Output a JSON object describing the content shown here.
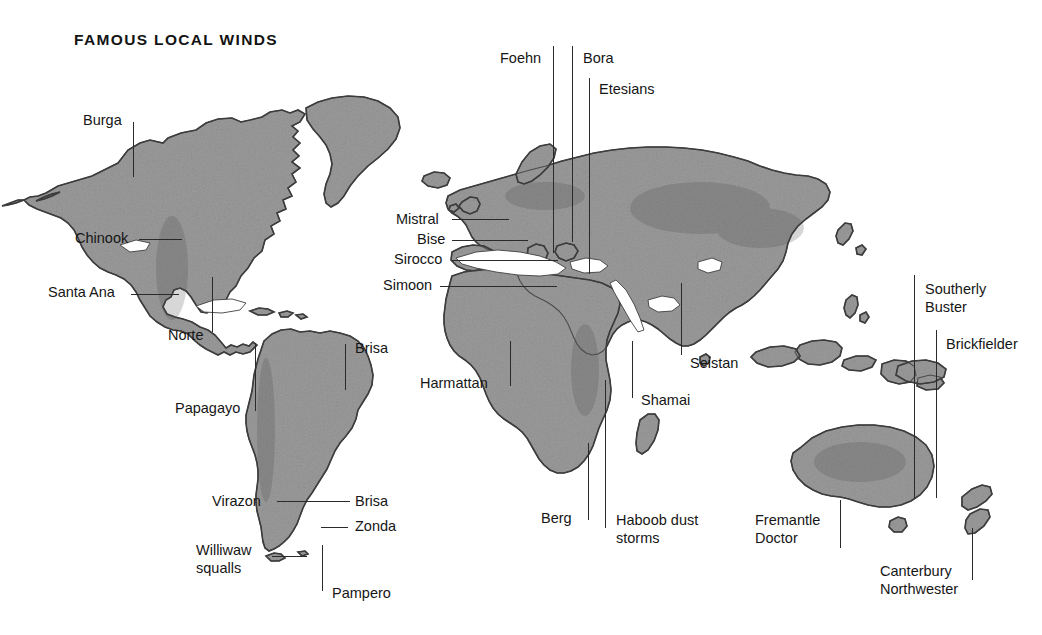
{
  "figure": {
    "title": "FAMOUS LOCAL WINDS",
    "background_color": "#ffffff",
    "land_color": "#9a9a9a",
    "coast_color": "#3a3a3a",
    "label_color": "#161616",
    "leader_color": "#2a2a2a",
    "width": 1042,
    "height": 635
  },
  "winds": [
    {
      "id": "burga",
      "name": "Burga",
      "label_x": 83,
      "label_y": 112,
      "align": "left"
    },
    {
      "id": "chinook",
      "name": "Chinook",
      "label_x": 75,
      "label_y": 230,
      "align": "left"
    },
    {
      "id": "santa-ana",
      "name": "Santa Ana",
      "label_x": 48,
      "label_y": 284,
      "align": "left"
    },
    {
      "id": "norte",
      "name": "Norte",
      "label_x": 168,
      "label_y": 327,
      "align": "left"
    },
    {
      "id": "brisa-north",
      "name": "Brisa",
      "label_x": 355,
      "label_y": 340,
      "align": "left"
    },
    {
      "id": "papagayo",
      "name": "Papagayo",
      "label_x": 175,
      "label_y": 400,
      "align": "left"
    },
    {
      "id": "virazon",
      "name": "Virazon",
      "label_x": 212,
      "label_y": 493,
      "align": "left"
    },
    {
      "id": "brisa-south",
      "name": "Brisa",
      "label_x": 355,
      "label_y": 493,
      "align": "left"
    },
    {
      "id": "zonda",
      "name": "Zonda",
      "label_x": 355,
      "label_y": 518,
      "align": "left"
    },
    {
      "id": "williwaw-squalls",
      "name": "Williwaw\nsqualls",
      "label_x": 196,
      "label_y": 542,
      "align": "left"
    },
    {
      "id": "pampero",
      "name": "Pampero",
      "label_x": 332,
      "label_y": 585,
      "align": "left"
    },
    {
      "id": "foehn",
      "name": "Foehn",
      "label_x": 500,
      "label_y": 50,
      "align": "left"
    },
    {
      "id": "bora",
      "name": "Bora",
      "label_x": 583,
      "label_y": 50,
      "align": "left"
    },
    {
      "id": "etesians",
      "name": "Etesians",
      "label_x": 599,
      "label_y": 81,
      "align": "left"
    },
    {
      "id": "mistral",
      "name": "Mistral",
      "label_x": 396,
      "label_y": 211,
      "align": "left"
    },
    {
      "id": "bise",
      "name": "Bise",
      "label_x": 417,
      "label_y": 231,
      "align": "left"
    },
    {
      "id": "sirocco",
      "name": "Sirocco",
      "label_x": 394,
      "label_y": 251,
      "align": "left"
    },
    {
      "id": "simoon",
      "name": "Simoon",
      "label_x": 383,
      "label_y": 277,
      "align": "left"
    },
    {
      "id": "harmattan",
      "name": "Harmattan",
      "label_x": 420,
      "label_y": 375,
      "align": "left"
    },
    {
      "id": "berg",
      "name": "Berg",
      "label_x": 541,
      "label_y": 510,
      "align": "left"
    },
    {
      "id": "haboob-dust-storms",
      "name": "Haboob dust\nstorms",
      "label_x": 616,
      "label_y": 512,
      "align": "left"
    },
    {
      "id": "shamai",
      "name": "Shamai",
      "label_x": 641,
      "label_y": 392,
      "align": "left"
    },
    {
      "id": "seistan",
      "name": "Seistan",
      "label_x": 690,
      "label_y": 355,
      "align": "left"
    },
    {
      "id": "southerly-buster",
      "name": "Southerly\nBuster",
      "label_x": 925,
      "label_y": 281,
      "align": "left"
    },
    {
      "id": "brickfielder",
      "name": "Brickfielder",
      "label_x": 946,
      "label_y": 336,
      "align": "left"
    },
    {
      "id": "fremantle-doctor",
      "name": "Fremantle\nDoctor",
      "label_x": 755,
      "label_y": 512,
      "align": "left"
    },
    {
      "id": "canterbury-northwester",
      "name": "Canterbury\nNorthwester",
      "label_x": 880,
      "label_y": 563,
      "align": "left"
    }
  ],
  "leaders": [
    {
      "id": "burga-leader",
      "orient": "vertical",
      "x": 133,
      "y": 122,
      "length": 55
    },
    {
      "id": "chinook-leader",
      "orient": "horizontal",
      "x": 139,
      "y": 239,
      "length": 43
    },
    {
      "id": "santa-ana-leader",
      "orient": "horizontal",
      "x": 131,
      "y": 294,
      "length": 48
    },
    {
      "id": "norte-leader",
      "orient": "vertical",
      "x": 212,
      "y": 277,
      "length": 55
    },
    {
      "id": "brisa-north-leader",
      "orient": "vertical",
      "x": 345,
      "y": 344,
      "length": 46
    },
    {
      "id": "papagayo-leader",
      "orient": "vertical",
      "x": 255,
      "y": 343,
      "length": 68
    },
    {
      "id": "virazon-leader",
      "orient": "horizontal",
      "x": 277,
      "y": 501,
      "length": 63
    },
    {
      "id": "brisa-south-leader",
      "orient": "horizontal",
      "x": 325,
      "y": 501,
      "length": 25
    },
    {
      "id": "zonda-leader",
      "orient": "horizontal",
      "x": 321,
      "y": 527,
      "length": 27
    },
    {
      "id": "williwaw-squalls-leader",
      "orient": "horizontal",
      "x": 272,
      "y": 556,
      "length": 35
    },
    {
      "id": "pampero-leader",
      "orient": "vertical",
      "x": 322,
      "y": 545,
      "length": 46
    },
    {
      "id": "foehn-leader",
      "orient": "vertical",
      "x": 553,
      "y": 46,
      "length": 207
    },
    {
      "id": "bora-leader",
      "orient": "vertical",
      "x": 572,
      "y": 46,
      "length": 196
    },
    {
      "id": "etesians-leader",
      "orient": "vertical",
      "x": 589,
      "y": 78,
      "length": 196
    },
    {
      "id": "mistral-leader",
      "orient": "horizontal",
      "x": 452,
      "y": 219,
      "length": 57
    },
    {
      "id": "bise-leader",
      "orient": "horizontal",
      "x": 452,
      "y": 240,
      "length": 76
    },
    {
      "id": "sirocco-leader",
      "orient": "horizontal",
      "x": 452,
      "y": 260,
      "length": 106
    },
    {
      "id": "simoon-leader",
      "orient": "horizontal",
      "x": 440,
      "y": 286,
      "length": 117
    },
    {
      "id": "harmattan-leader",
      "orient": "vertical",
      "x": 510,
      "y": 341,
      "length": 45
    },
    {
      "id": "berg-leader",
      "orient": "vertical",
      "x": 588,
      "y": 443,
      "length": 77
    },
    {
      "id": "haboob-dust-storms-leader",
      "orient": "vertical",
      "x": 605,
      "y": 380,
      "length": 148
    },
    {
      "id": "shamai-leader",
      "orient": "vertical",
      "x": 632,
      "y": 341,
      "length": 57
    },
    {
      "id": "seistan-leader",
      "orient": "vertical",
      "x": 681,
      "y": 283,
      "length": 72
    },
    {
      "id": "southerly-buster-leader",
      "orient": "vertical",
      "x": 914,
      "y": 275,
      "length": 223
    },
    {
      "id": "brickfielder-leader",
      "orient": "vertical",
      "x": 936,
      "y": 330,
      "length": 168
    },
    {
      "id": "fremantle-doctor-leader",
      "orient": "vertical",
      "x": 840,
      "y": 500,
      "length": 48
    },
    {
      "id": "canterbury-northwester-leader",
      "orient": "vertical",
      "x": 972,
      "y": 528,
      "length": 52
    }
  ]
}
